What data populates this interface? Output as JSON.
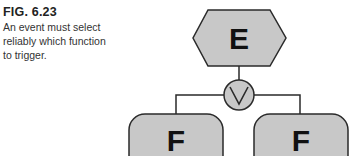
{
  "figure": {
    "label": "FIG. 6.23",
    "caption_lines": [
      "An event must select",
      "reliably which function",
      "to trigger."
    ]
  },
  "diagram": {
    "event": {
      "label": "E",
      "shape": "hexagon"
    },
    "connector": {
      "type": "XOR",
      "symbol": "∨",
      "shape": "circle"
    },
    "functions": [
      {
        "label": "F",
        "shape": "rounded-rectangle"
      },
      {
        "label": "F",
        "shape": "rounded-rectangle"
      }
    ],
    "colors": {
      "fill": "#c8c8c8",
      "stroke": "#2a2a2a",
      "text": "#111111"
    }
  }
}
